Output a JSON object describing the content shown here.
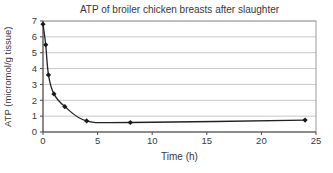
{
  "chart_data": {
    "type": "line",
    "title": "ATP of broiler chicken breasts after slaughter",
    "xlabel": "Time (h)",
    "ylabel": "ATP (micromol/g tissue)",
    "x": [
      0,
      0.25,
      0.5,
      1,
      2,
      4,
      8,
      24
    ],
    "y": [
      6.8,
      5.5,
      3.6,
      2.4,
      1.6,
      0.7,
      0.6,
      0.75
    ],
    "xlim": [
      0,
      25
    ],
    "ylim": [
      0,
      7
    ],
    "x_ticks": [
      0,
      5,
      10,
      15,
      20,
      25
    ],
    "y_ticks": [
      0,
      1,
      2,
      3,
      4,
      5,
      6,
      7
    ],
    "grid": "horizontal",
    "legend": "none",
    "marker": "diamond",
    "line_style": "smooth",
    "colors": {
      "line": "#222222",
      "marker": "#1a1a1a",
      "gridline": "#c8c8c8",
      "plot_border": "#9a9a9a",
      "axis": "#4a4a4a",
      "text": "#3a3a3a",
      "background": "#ffffff"
    }
  }
}
